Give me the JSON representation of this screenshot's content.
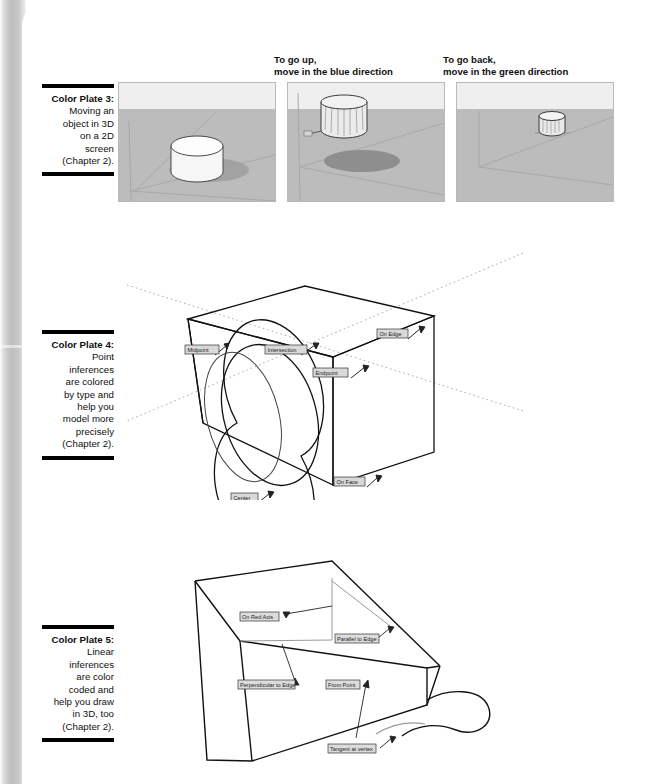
{
  "page": {
    "background": "#ffffff",
    "scan_edge_color": "#bdbdbd"
  },
  "plates": [
    {
      "id": "color-plate-3",
      "lead": "Color Plate 3:",
      "lines": [
        "Moving an",
        "object in 3D",
        "on a 2D",
        "screen",
        "(Chapter 2)."
      ],
      "panel_captions": [
        {
          "id": "panel-caption-2",
          "lines": [
            "To go up,",
            "move in the blue direction"
          ]
        },
        {
          "id": "panel-caption-3",
          "lines": [
            "To go back,",
            "move in the green direction"
          ]
        }
      ],
      "panels": [
        {
          "id": "viewport-1",
          "state": "cylinder resting on ground"
        },
        {
          "id": "viewport-2",
          "state": "cylinder moved up, shadow below"
        },
        {
          "id": "viewport-3",
          "state": "cylinder moved back along green axis"
        }
      ],
      "colors": {
        "sky": "#efefef",
        "ground": "#bcbcbc",
        "object": "#f4f4f4",
        "shadow": "#8f8f8f"
      }
    },
    {
      "id": "color-plate-4",
      "lead": "Color Plate 4:",
      "lines": [
        "Point",
        "inferences",
        "are colored",
        "by type and",
        "help you",
        "model more",
        "precisely",
        "(Chapter 2)."
      ],
      "figure": {
        "id": "point-inference-figure",
        "shape": "box with circle on front face, dotted axis lines",
        "labels": [
          {
            "id": "label-midpoint",
            "text": "Midpoint"
          },
          {
            "id": "label-intersection",
            "text": "Intersection"
          },
          {
            "id": "label-on-edge",
            "text": "On Edge"
          },
          {
            "id": "label-endpoint",
            "text": "Endpoint"
          },
          {
            "id": "label-on-face",
            "text": "On Face"
          },
          {
            "id": "label-center",
            "text": "Center"
          }
        ]
      }
    },
    {
      "id": "color-plate-5",
      "lead": "Color Plate 5:",
      "lines": [
        "Linear",
        "inferences",
        "are color",
        "coded and",
        "help you draw",
        "in 3D, too",
        "(Chapter 2)."
      ],
      "figure": {
        "id": "linear-inference-figure",
        "shape": "open box viewed from above with freeform curve at right",
        "labels": [
          {
            "id": "label-on-red-axis",
            "text": "On Red Axis"
          },
          {
            "id": "label-parallel-to-edge",
            "text": "Parallel to Edge"
          },
          {
            "id": "label-perpendicular-to-edge",
            "text": "Perpendicular to Edge"
          },
          {
            "id": "label-from-point",
            "text": "From Point"
          },
          {
            "id": "label-tangent-at-vertex",
            "text": "Tangent at vertex"
          }
        ]
      }
    }
  ]
}
